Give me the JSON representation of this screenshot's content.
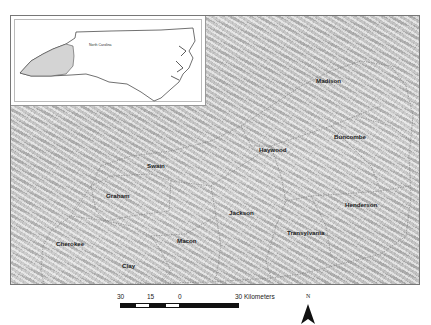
{
  "inset": {
    "label": "North Carolina",
    "highlight_color": "#d4d4d4",
    "outline_color": "#333333"
  },
  "counties": [
    {
      "name": "Madison",
      "x": 316,
      "y": 80
    },
    {
      "name": "Buncombe",
      "x": 334,
      "y": 135
    },
    {
      "name": "Haywood",
      "x": 259,
      "y": 146
    },
    {
      "name": "Swain",
      "x": 148,
      "y": 162
    },
    {
      "name": "Graham",
      "x": 106,
      "y": 192
    },
    {
      "name": "Henderson",
      "x": 345,
      "y": 202
    },
    {
      "name": "Jackson",
      "x": 229,
      "y": 209
    },
    {
      "name": "Transylvania",
      "x": 287,
      "y": 230
    },
    {
      "name": "Cherokee",
      "x": 56,
      "y": 240
    },
    {
      "name": "Macon",
      "x": 177,
      "y": 237
    },
    {
      "name": "Clay",
      "x": 122,
      "y": 262
    }
  ],
  "scale_bar": {
    "labels": [
      "30",
      "15",
      "0",
      "30 Kilometers"
    ],
    "unit": "Kilometers"
  },
  "north_arrow": {
    "label": "N"
  }
}
